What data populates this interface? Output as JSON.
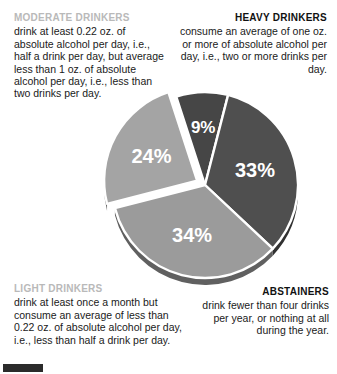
{
  "callouts": {
    "moderate": {
      "heading": "MODERATE DRINKERS",
      "body": "drink at least 0.22 oz. of absolute alcohol per day, i.e., half a drink per day, but average less than 1 oz. of absolute alcohol per day, i.e., less than two drinks per day."
    },
    "heavy": {
      "heading": "HEAVY DRINKERS",
      "body": "consume an average of one oz. or more of absolute alcohol per day, i.e., two or more drinks per day."
    },
    "light": {
      "heading": "LIGHT DRINKERS",
      "body": "drink at least once a month but consume an average of less than 0.22 oz. of absolute alcohol per day, i.e., less than half a drink per day."
    },
    "abstainers": {
      "heading": "ABSTAINERS",
      "body": "drink fewer than four drinks per year, or nothing at all during the year."
    }
  },
  "chart_data": {
    "type": "pie",
    "title": "",
    "categories": [
      "Heavy Drinkers",
      "Abstainers",
      "Light Drinkers",
      "Moderate Drinkers"
    ],
    "values": [
      9,
      33,
      34,
      24
    ],
    "labels": [
      "9%",
      "33%",
      "34%",
      "24%"
    ],
    "colors": [
      "#464646",
      "#4f4f4f",
      "#9b9b9b",
      "#a4a4a4"
    ],
    "label_color": "#ffffff",
    "separator_color": "#ffffff",
    "exploded": [
      "Moderate Drinkers"
    ],
    "legend": "none",
    "grid": false,
    "start_angle_deg": -18,
    "units": "percent",
    "total": 100
  },
  "decoration": {
    "bottom_bar_color": "#2b2b2b"
  }
}
